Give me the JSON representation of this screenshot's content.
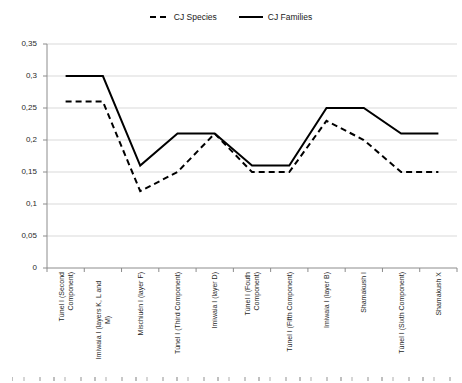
{
  "legend": {
    "species_label": "CJ Species",
    "families_label": "CJ Families"
  },
  "chart_data": {
    "type": "line",
    "title": "",
    "xlabel": "",
    "ylabel": "",
    "categories": [
      "Túnel I (Second\nComponent)",
      "Imiwaia I (layers K, L and\nM)",
      "Mischiuén I (layer F)",
      "Túnel I (Third Component)",
      "Imiwaia I (layer D)",
      "Túnel I (Fouth\nComponent)",
      "Túnel I (Fifth Component)",
      "Imiwaia I (layer B)",
      "Shamakush I",
      "Túnel I (Sixth Component)",
      "Shamakush X"
    ],
    "series": [
      {
        "name": "CJ Species",
        "line_style": "dashed",
        "values": [
          0.26,
          0.26,
          0.12,
          0.15,
          0.21,
          0.15,
          0.15,
          0.23,
          0.2,
          0.15,
          0.15
        ]
      },
      {
        "name": "CJ Families",
        "line_style": "solid",
        "values": [
          0.3,
          0.3,
          0.16,
          0.21,
          0.21,
          0.16,
          0.16,
          0.25,
          0.25,
          0.21,
          0.21
        ]
      }
    ],
    "ylim": [
      0,
      0.35
    ],
    "ytick_step": 0.05,
    "ytick_labels": [
      "0",
      "0,05",
      "0,1",
      "0,15",
      "0,2",
      "0,25",
      "0,3",
      "0,35"
    ],
    "decimal_separator": ",",
    "grid": "horizontal-only",
    "legend_position": "top-center",
    "colors": {
      "line": "#000000",
      "grid": "#d9d9d9",
      "axis": "#8c8c8c"
    }
  }
}
